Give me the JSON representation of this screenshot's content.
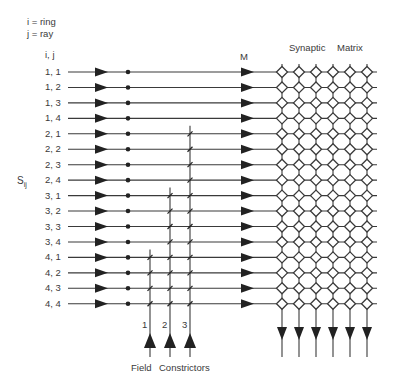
{
  "legend": {
    "line1": "i = ring",
    "line2": "j = ray"
  },
  "header": {
    "ij_label": "i, j",
    "m_label": "M",
    "matrix_title_1": "Synaptic",
    "matrix_title_2": "Matrix"
  },
  "side_label": {
    "main": "S",
    "sub": "ij"
  },
  "rows": [
    {
      "label": "1, 1"
    },
    {
      "label": "1, 2"
    },
    {
      "label": "1, 3"
    },
    {
      "label": "1, 4"
    },
    {
      "label": "2, 1"
    },
    {
      "label": "2, 2"
    },
    {
      "label": "2, 3"
    },
    {
      "label": "2, 4"
    },
    {
      "label": "3, 1"
    },
    {
      "label": "3, 2"
    },
    {
      "label": "3, 3"
    },
    {
      "label": "3, 4"
    },
    {
      "label": "4, 1"
    },
    {
      "label": "4, 2"
    },
    {
      "label": "4, 3"
    },
    {
      "label": "4, 4"
    }
  ],
  "constrictors": [
    {
      "label": "1",
      "x": 150,
      "first_row": 12
    },
    {
      "label": "2",
      "x": 170,
      "first_row": 8
    },
    {
      "label": "3",
      "x": 190,
      "first_row": 4
    }
  ],
  "footer": {
    "label_1": "Field",
    "label_2": "Constrictors"
  },
  "matrix": {
    "columns": 6,
    "rows": 16
  },
  "colors": {
    "line": "#3a3a3a",
    "fill": "#222222"
  }
}
